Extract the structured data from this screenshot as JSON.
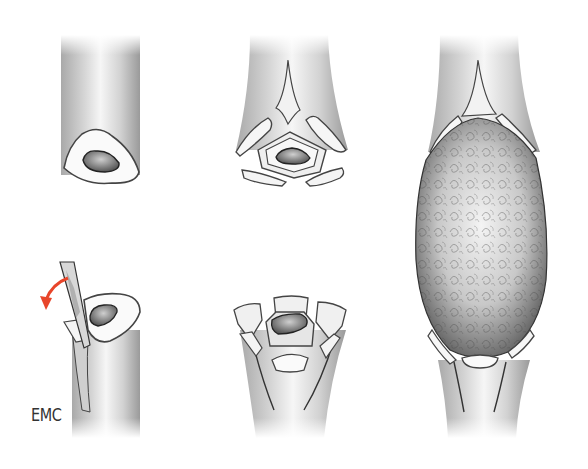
{
  "figure": {
    "panels": [
      {
        "id": "top-left",
        "label": "Intact bone shaft, transverse section showing medullary canal"
      },
      {
        "id": "top-middle",
        "label": "Proximal fragment with raised cortical petals (flaps) around canal"
      },
      {
        "id": "bottom-left",
        "label": "Distal fragment with osteotome raising a cortical flap"
      },
      {
        "id": "bottom-middle",
        "label": "Distal fragment with multiple raised cortical flaps around canal"
      },
      {
        "id": "right",
        "label": "Reconstructed segment: cancellous bone graft bridging between flaps"
      }
    ],
    "arrow_color": "#e8452a",
    "credit": "EMC"
  }
}
